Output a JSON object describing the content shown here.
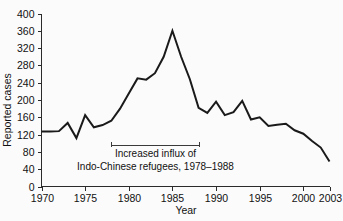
{
  "chart_data": {
    "type": "line",
    "title": "",
    "xlabel": "Year",
    "ylabel": "Reported cases",
    "xlim": [
      1970,
      2003
    ],
    "ylim": [
      0,
      400
    ],
    "grid": false,
    "legend": "none",
    "xticks": [
      1970,
      1975,
      1980,
      1985,
      1990,
      1995,
      2000,
      2003
    ],
    "xtick_labels": [
      "1970",
      "1975",
      "1980",
      "1985",
      "1990",
      "1995",
      "2000",
      "2003"
    ],
    "yticks": [
      0,
      40,
      80,
      120,
      160,
      200,
      240,
      280,
      320,
      360,
      400
    ],
    "ytick_labels": [
      "0",
      "40",
      "80",
      "120",
      "160",
      "200",
      "240",
      "280",
      "320",
      "360",
      "400"
    ],
    "x": [
      1970,
      1971,
      1972,
      1973,
      1974,
      1975,
      1976,
      1977,
      1978,
      1979,
      1980,
      1981,
      1982,
      1983,
      1984,
      1985,
      1986,
      1987,
      1988,
      1989,
      1990,
      1991,
      1992,
      1993,
      1994,
      1995,
      1996,
      1997,
      1998,
      1999,
      2000,
      2001,
      2002,
      2003
    ],
    "values": [
      127,
      127,
      128,
      147,
      112,
      165,
      137,
      142,
      152,
      180,
      215,
      250,
      247,
      262,
      300,
      360,
      300,
      248,
      182,
      170,
      196,
      165,
      172,
      198,
      155,
      160,
      140,
      143,
      145,
      130,
      122,
      105,
      90,
      58
    ],
    "annotations": [
      {
        "lines": [
          "Increased influx of",
          "Indo-Chinese refugees, 1978–1988"
        ],
        "bracket_start_year": 1978,
        "bracket_end_year": 1988,
        "bracket_value": 96
      }
    ]
  },
  "axes": {
    "y_title": "Reported cases",
    "x_title": "Year"
  }
}
